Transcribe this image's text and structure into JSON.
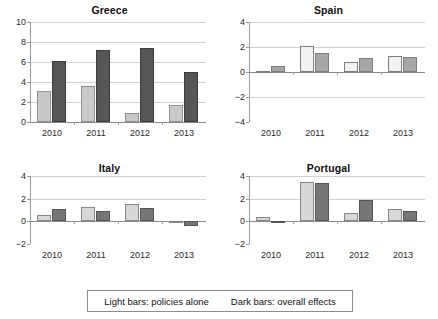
{
  "legend": {
    "light_label": "Light bars: policies alone",
    "dark_label": "Dark bars: overall effects"
  },
  "colors": {
    "light_bar_greece": "#c9c9c9",
    "dark_bar_greece": "#565656",
    "light_bar_other": "#f2f2f2",
    "dark_bar_other": "#a6a6a6",
    "light_bar_italy": "#d8d8d8",
    "dark_bar_italy": "#767676",
    "gridline": "#d2d2d2",
    "axis": "#9a9a9a"
  },
  "chart_data": [
    {
      "type": "bar",
      "title": "Greece",
      "categories": [
        "2010",
        "2011",
        "2012",
        "2013"
      ],
      "xlabel": "",
      "ylabel": "",
      "ylim": [
        0,
        10
      ],
      "yticks": [
        0,
        2,
        4,
        6,
        8,
        10
      ],
      "grid": true,
      "legend_position": "bottom-shared",
      "series": [
        {
          "name": "policies alone",
          "style": "light",
          "values": [
            3.1,
            3.6,
            0.9,
            1.7
          ]
        },
        {
          "name": "overall effects",
          "style": "dark",
          "values": [
            6.1,
            7.25,
            7.4,
            5.05
          ]
        }
      ]
    },
    {
      "type": "bar",
      "title": "Spain",
      "categories": [
        "2010",
        "2011",
        "2012",
        "2013"
      ],
      "xlabel": "",
      "ylabel": "",
      "ylim": [
        -4,
        4
      ],
      "yticks": [
        -4,
        -2,
        0,
        2,
        4
      ],
      "grid": true,
      "legend_position": "bottom-shared",
      "series": [
        {
          "name": "policies alone",
          "style": "light",
          "values": [
            0.1,
            2.1,
            0.8,
            1.25
          ]
        },
        {
          "name": "overall effects",
          "style": "dark",
          "values": [
            0.5,
            1.5,
            1.1,
            1.2
          ]
        }
      ]
    },
    {
      "type": "bar",
      "title": "Italy",
      "categories": [
        "2010",
        "2011",
        "2012",
        "2013"
      ],
      "xlabel": "",
      "ylabel": "",
      "ylim": [
        -2,
        4
      ],
      "yticks": [
        -2,
        0,
        2,
        4
      ],
      "grid": true,
      "legend_position": "bottom-shared",
      "series": [
        {
          "name": "policies alone",
          "style": "light",
          "values": [
            0.6,
            1.25,
            1.55,
            -0.05
          ]
        },
        {
          "name": "overall effects",
          "style": "dark",
          "values": [
            1.05,
            0.95,
            1.2,
            -0.4
          ]
        }
      ]
    },
    {
      "type": "bar",
      "title": "Portugal",
      "categories": [
        "2010",
        "2011",
        "2012",
        "2013"
      ],
      "xlabel": "",
      "ylabel": "",
      "ylim": [
        -2,
        4
      ],
      "yticks": [
        -2,
        0,
        2,
        4
      ],
      "grid": true,
      "legend_position": "bottom-shared",
      "series": [
        {
          "name": "policies alone",
          "style": "light",
          "values": [
            0.4,
            3.45,
            0.7,
            1.05
          ]
        },
        {
          "name": "overall effects",
          "style": "dark",
          "values": [
            -0.15,
            3.4,
            1.9,
            0.9
          ]
        }
      ]
    }
  ]
}
